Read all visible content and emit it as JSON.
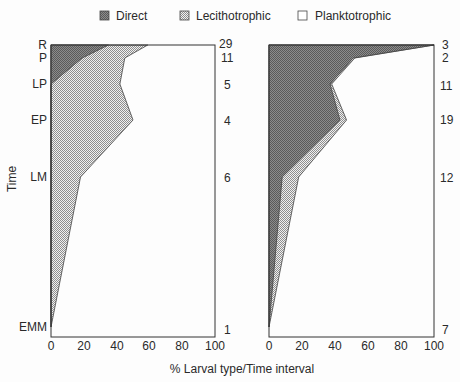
{
  "legend": {
    "direct": "Direct",
    "lecithotrophic": "Lecithotrophic",
    "planktotrophic": "Planktotrophic"
  },
  "axes": {
    "ylabel": "Time",
    "xlabel": "% Larval type/Time interval",
    "xticks": [
      "0",
      "20",
      "40",
      "60",
      "80",
      "100"
    ]
  },
  "intervals": [
    "R",
    "P",
    "LP",
    "EP",
    "LM",
    "EMM"
  ],
  "colors": {
    "direct_fill": "#8c8c8c",
    "direct_dot": "#555555",
    "lecith_fill": "#f2f2f2",
    "lecith_dot": "#9a9a9a",
    "plankto_fill": "#ffffff",
    "frame": "#333333"
  },
  "chart_data": [
    {
      "type": "area",
      "panel": "left",
      "title": "",
      "ylabel": "Time",
      "xlabel": "% Larval type/Time interval",
      "xlim": [
        0,
        100
      ],
      "categories": [
        "R",
        "P",
        "LP",
        "EP",
        "LM",
        "EMM"
      ],
      "counts": [
        "29",
        "11",
        "5",
        "4",
        "6",
        "1"
      ],
      "series": [
        {
          "name": "Direct",
          "values": [
            35,
            19,
            0,
            0,
            0,
            0
          ]
        },
        {
          "name": "Lecithotrophic",
          "values": [
            24,
            26,
            42,
            50,
            18,
            0
          ]
        },
        {
          "name": "Planktotrophic",
          "values": [
            41,
            55,
            58,
            50,
            82,
            100
          ]
        }
      ],
      "legend_position": "top",
      "grid": false
    },
    {
      "type": "area",
      "panel": "right",
      "title": "",
      "xlabel": "% Larval type/Time interval",
      "xlim": [
        0,
        100
      ],
      "categories": [
        "R",
        "P",
        "LP",
        "EP",
        "LM",
        "EMM"
      ],
      "counts": [
        "3",
        "2",
        "11",
        "19",
        "12",
        "7"
      ],
      "series": [
        {
          "name": "Direct",
          "values": [
            100,
            51,
            37,
            43,
            8,
            0
          ]
        },
        {
          "name": "Lecithotrophic",
          "values": [
            0,
            1,
            1,
            4,
            10,
            0
          ]
        },
        {
          "name": "Planktotrophic",
          "values": [
            0,
            48,
            62,
            53,
            82,
            100
          ]
        }
      ],
      "legend_position": "top",
      "grid": false
    }
  ]
}
